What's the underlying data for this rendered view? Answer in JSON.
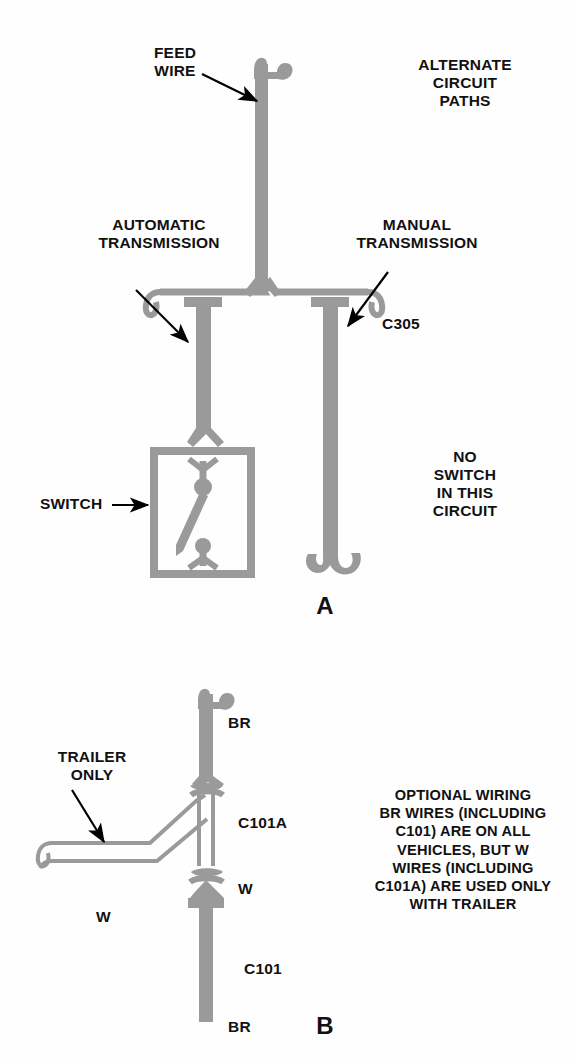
{
  "figure": {
    "title_letters": {
      "panel_a": "A",
      "panel_b": "B"
    },
    "colors": {
      "wire_fill": "#9a9a9a",
      "wire_stroke": "#8f8f8f",
      "text": "#111111",
      "background": "#fefefe",
      "arrow": "#000000"
    }
  },
  "panel_a": {
    "labels": {
      "feed_wire": "FEED\nWIRE",
      "alternate_circuit_paths": "ALTERNATE\nCIRCUIT\nPATHS",
      "automatic_transmission": "AUTOMATIC\nTRANSMISSION",
      "manual_transmission": "MANUAL\nTRANSMISSION",
      "connector_c305": "C305",
      "switch": "SWITCH",
      "no_switch_note": "NO\nSWITCH\nIN THIS\nCIRCUIT"
    }
  },
  "panel_b": {
    "labels": {
      "wire_br_top": "BR",
      "wire_br_bottom": "BR",
      "wire_w_vertical": "W",
      "wire_w_horizontal": "W",
      "connector_c101a": "C101A",
      "connector_c101": "C101",
      "trailer_only": "TRAILER\nONLY",
      "optional_wiring_note": "OPTIONAL WIRING\nBR WIRES (INCLUDING\nC101) ARE ON ALL\nVEHICLES, BUT W\nWIRES (INCLUDING\nC101A) ARE USED ONLY\nWITH TRAILER"
    }
  }
}
